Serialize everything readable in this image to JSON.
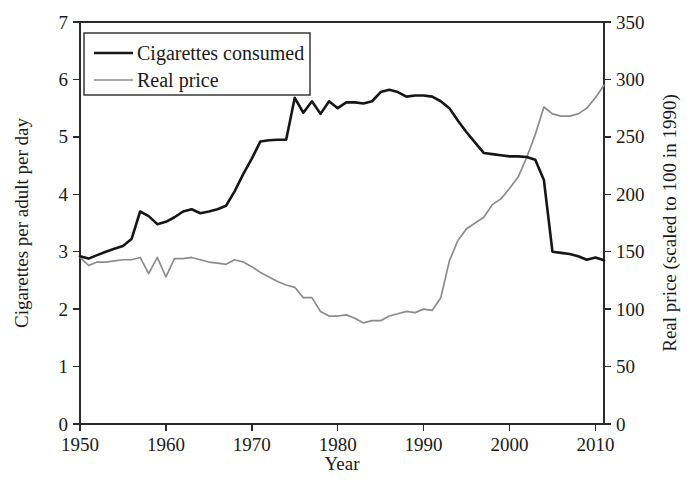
{
  "figure": {
    "background_color": "#ffffff",
    "series_colors": {
      "cigarettes": "#161616",
      "price": "#8c8c8c"
    }
  },
  "legend": {
    "position": "top-left-inside",
    "entries": [
      {
        "label": "Cigarettes consumed",
        "color": "#161616"
      },
      {
        "label": "Real price",
        "color": "#8c8c8c"
      }
    ]
  },
  "axes": {
    "x": {
      "label": "Year",
      "min": 1950,
      "max": 2011,
      "ticks": [
        1950,
        1960,
        1970,
        1980,
        1990,
        2000,
        2010
      ],
      "tick_labels": [
        "1950",
        "1960",
        "1970",
        "1980",
        "1990",
        "2000",
        "2010"
      ]
    },
    "y_left": {
      "label": "Cigarettes per adult per day",
      "min": 0,
      "max": 7,
      "ticks": [
        0,
        1,
        2,
        3,
        4,
        5,
        6,
        7
      ],
      "tick_labels": [
        "0",
        "1",
        "2",
        "3",
        "4",
        "5",
        "6",
        "7"
      ]
    },
    "y_right": {
      "label": "Real price (scaled to 100 in 1990)",
      "min": 0,
      "max": 350,
      "ticks": [
        0,
        50,
        100,
        150,
        200,
        250,
        300,
        350
      ],
      "tick_labels": [
        "0",
        "50",
        "100",
        "150",
        "200",
        "250",
        "300",
        "350"
      ]
    }
  },
  "chart_data": {
    "type": "line",
    "title": "",
    "xlabel": "Year",
    "ylabel": "Cigarettes per adult per day",
    "ylabel_secondary": "Real price (scaled to 100 in 1990)",
    "xlim": [
      1950,
      2011
    ],
    "ylim": [
      0,
      7
    ],
    "ylim_secondary": [
      0,
      350
    ],
    "grid": false,
    "legend_position": "upper left",
    "x": [
      1950,
      1951,
      1952,
      1953,
      1954,
      1955,
      1956,
      1957,
      1958,
      1959,
      1960,
      1961,
      1962,
      1963,
      1964,
      1965,
      1966,
      1967,
      1968,
      1969,
      1970,
      1971,
      1972,
      1973,
      1974,
      1975,
      1976,
      1977,
      1978,
      1979,
      1980,
      1981,
      1982,
      1983,
      1984,
      1985,
      1986,
      1987,
      1988,
      1989,
      1990,
      1991,
      1992,
      1993,
      1994,
      1995,
      1996,
      1997,
      1998,
      1999,
      2000,
      2001,
      2002,
      2003,
      2004,
      2005,
      2006,
      2007,
      2008,
      2009,
      2010,
      2011
    ],
    "series": [
      {
        "name": "Cigarettes consumed",
        "axis": "left",
        "units": "cigarettes per adult per day",
        "color": "#161616",
        "values": [
          2.92,
          2.88,
          2.94,
          3.0,
          3.05,
          3.1,
          3.22,
          3.7,
          3.62,
          3.48,
          3.52,
          3.6,
          3.7,
          3.74,
          3.67,
          3.7,
          3.74,
          3.8,
          4.05,
          4.35,
          4.62,
          4.92,
          4.94,
          4.95,
          4.95,
          5.68,
          5.42,
          5.62,
          5.4,
          5.62,
          5.5,
          5.6,
          5.6,
          5.58,
          5.62,
          5.78,
          5.82,
          5.78,
          5.7,
          5.72,
          5.72,
          5.7,
          5.62,
          5.5,
          5.28,
          5.08,
          4.9,
          4.72,
          4.7,
          4.68,
          4.66,
          4.66,
          4.65,
          4.6,
          4.25,
          3.0,
          2.98,
          2.96,
          2.92,
          2.86,
          2.9,
          2.85
        ]
      },
      {
        "name": "Real price",
        "axis": "right",
        "units": "index, 1990 = 100",
        "color": "#8c8c8c",
        "values": [
          145,
          138,
          141,
          141,
          142,
          143,
          143,
          145,
          131,
          145,
          128,
          144,
          144,
          145,
          143,
          141,
          140,
          139,
          143,
          141,
          137,
          132,
          128,
          124,
          121,
          119,
          110,
          110,
          98,
          94,
          94,
          95,
          92,
          88,
          90,
          90,
          94,
          96,
          98,
          97,
          100,
          99,
          110,
          142,
          160,
          170,
          175,
          180,
          191,
          196,
          205,
          215,
          232,
          252,
          276,
          270,
          268,
          268,
          270,
          275,
          284,
          295
        ]
      }
    ]
  }
}
